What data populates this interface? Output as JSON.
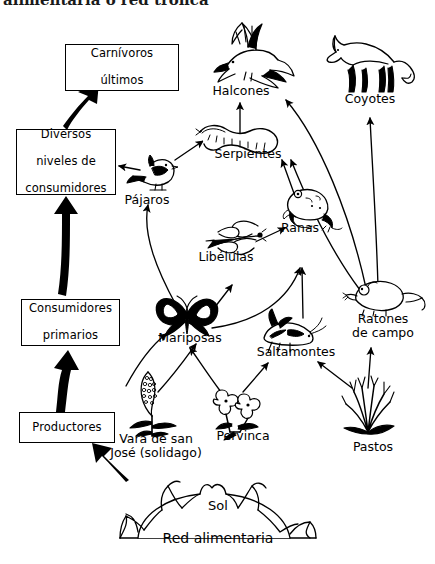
{
  "page": {
    "top_title_partial": "alimentaria o red trófica",
    "caption": "Red alimentaria",
    "sun_label": "Sol",
    "ink": "#000000",
    "background": "#ffffff"
  },
  "trophic_boxes": [
    {
      "id": "carnivoros-ultimos",
      "line1": "Carnívoros",
      "line2": "últimos"
    },
    {
      "id": "diversos-niveles",
      "line1": "Diversos",
      "line2": "niveles de",
      "line3": "consumidores"
    },
    {
      "id": "consumidores-primarios",
      "line1": "Consumidores",
      "line2": "primarios"
    },
    {
      "id": "productores",
      "line1": "Productores"
    }
  ],
  "organisms": [
    {
      "id": "halcones",
      "label": "Halcones",
      "icon": "hawk-icon"
    },
    {
      "id": "coyotes",
      "label": "Coyotes",
      "icon": "coyote-icon"
    },
    {
      "id": "serpientes",
      "label": "Serpientes",
      "icon": "snake-icon"
    },
    {
      "id": "pajaros",
      "label": "Pájaros",
      "icon": "bird-icon"
    },
    {
      "id": "ranas",
      "label": "Ranas",
      "icon": "frog-icon"
    },
    {
      "id": "libelulas",
      "label": "Libélulas",
      "icon": "dragonfly-icon"
    },
    {
      "id": "mariposas",
      "label": "Mariposas",
      "icon": "butterfly-icon"
    },
    {
      "id": "saltamontes",
      "label": "Saltamontes",
      "icon": "grasshopper-icon"
    },
    {
      "id": "ratones",
      "label": "Ratones\nde campo",
      "label_line1": "Ratones",
      "label_line2": "de campo",
      "icon": "mouse-icon"
    },
    {
      "id": "vara",
      "label": "Vara de san\nJosé (solidago)",
      "label_line1": "Vara de san",
      "label_line2": "José (solidago)",
      "icon": "goldenrod-icon"
    },
    {
      "id": "pervinca",
      "label": "Pervinca",
      "icon": "periwinkle-icon"
    },
    {
      "id": "pastos",
      "label": "Pastos",
      "icon": "grass-icon"
    },
    {
      "id": "sol",
      "label": "Sol",
      "icon": "sun-icon"
    }
  ],
  "arrows": [
    {
      "from": "diversos-niveles",
      "to": "carnivoros-ultimos",
      "style": "thick"
    },
    {
      "from": "consumidores-primarios",
      "to": "diversos-niveles",
      "style": "thick"
    },
    {
      "from": "productores",
      "to": "consumidores-primarios",
      "style": "thick"
    },
    {
      "from": "sol",
      "to": "productores",
      "style": "thick"
    },
    {
      "from": "pajaros",
      "to": "diversos-niveles",
      "style": "thin"
    },
    {
      "from": "pajaros",
      "to": "serpientes",
      "style": "thin"
    },
    {
      "from": "mariposas",
      "to": "pajaros",
      "style": "thin"
    },
    {
      "from": "mariposas",
      "to": "libelulas",
      "style": "thin"
    },
    {
      "from": "mariposas",
      "to": "ranas",
      "style": "thin"
    },
    {
      "from": "libelulas",
      "to": "ranas",
      "style": "thin"
    },
    {
      "from": "ranas",
      "to": "serpientes",
      "style": "thin"
    },
    {
      "from": "saltamontes",
      "to": "ranas",
      "style": "thin"
    },
    {
      "from": "serpientes",
      "to": "halcones",
      "style": "thin"
    },
    {
      "from": "ratones",
      "to": "serpientes",
      "style": "thin"
    },
    {
      "from": "ratones",
      "to": "halcones",
      "style": "thin"
    },
    {
      "from": "ratones",
      "to": "coyotes",
      "style": "thin"
    },
    {
      "from": "vara",
      "to": "mariposas",
      "style": "thin"
    },
    {
      "from": "pervinca",
      "to": "mariposas",
      "style": "thin"
    },
    {
      "from": "pervinca",
      "to": "saltamontes",
      "style": "thin"
    },
    {
      "from": "pastos",
      "to": "saltamontes",
      "style": "thin"
    },
    {
      "from": "pastos",
      "to": "ratones",
      "style": "thin"
    }
  ]
}
